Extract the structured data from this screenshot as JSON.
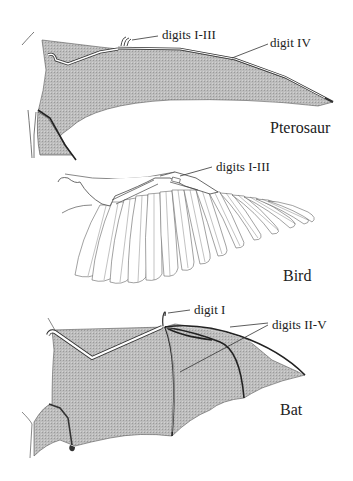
{
  "figure": {
    "panels": [
      {
        "id": "pterosaur",
        "name": "Pterosaur",
        "annotations": [
          {
            "text": "digits I-III"
          },
          {
            "text": "digit IV"
          }
        ]
      },
      {
        "id": "bird",
        "name": "Bird",
        "annotations": [
          {
            "text": "digits I-III"
          }
        ]
      },
      {
        "id": "bat",
        "name": "Bat",
        "annotations": [
          {
            "text": "digit I"
          },
          {
            "text": "digits II-V"
          }
        ]
      }
    ],
    "colors": {
      "membrane": "#b8b8b8",
      "outline": "#333333",
      "bone": "#ffffff",
      "text": "#222222"
    }
  }
}
